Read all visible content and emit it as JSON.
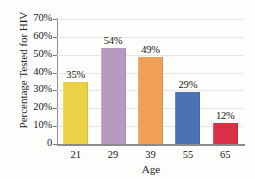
{
  "figure": {
    "title_sliver": "",
    "background": "#fdfdfb"
  },
  "chart_data": {
    "type": "bar",
    "title": "",
    "xlabel": "Age",
    "ylabel": "Percentage Tested for HIV",
    "categories": [
      "21",
      "29",
      "39",
      "55",
      "65"
    ],
    "values": [
      35,
      54,
      49,
      29,
      12
    ],
    "value_labels": [
      "35%",
      "54%",
      "49%",
      "29%",
      "12%"
    ],
    "bar_colors": [
      "#edd144",
      "#b79ac0",
      "#efa055",
      "#4a72b5",
      "#da2f45"
    ],
    "ylim": [
      0,
      70
    ],
    "ytick_values": [
      0,
      10,
      20,
      30,
      40,
      50,
      60,
      70
    ],
    "ytick_labels": [
      "0",
      "10%",
      "20%",
      "30%",
      "40%",
      "50%",
      "60%",
      "70%"
    ],
    "grid": true,
    "grid_color": "#e6e6e4",
    "legend": "none",
    "axis_color": "#8a8a8e"
  }
}
